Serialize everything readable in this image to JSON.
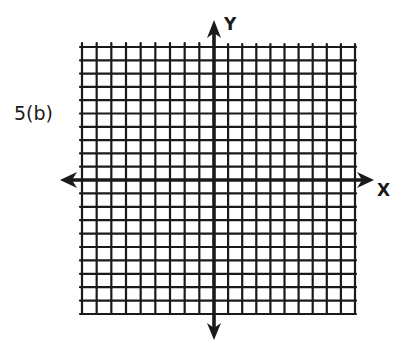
{
  "problem_label": "5(b)",
  "axes": {
    "x_label": "X",
    "y_label": "Y"
  },
  "grid": {
    "columns": 19,
    "rows": 20,
    "cells_left_of_y_axis": 9,
    "cells_right_of_y_axis": 10,
    "cells_above_x_axis": 10,
    "cells_below_x_axis": 10,
    "left": 82,
    "right": 355,
    "top": 47,
    "bottom": 314,
    "origin_x": 214,
    "origin_y": 180
  },
  "colors": {
    "ink": "#1a1a1a",
    "paper": "#ffffff"
  }
}
